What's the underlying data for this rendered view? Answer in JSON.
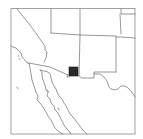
{
  "map": {
    "type": "locator-map",
    "region": "Southwestern United States and Northwestern Mexico",
    "highlight": {
      "shape": "square",
      "color": "#2a2a2a",
      "location": "southeastern Arizona, near US-Mexico border"
    },
    "colors": {
      "background": "#ffffff",
      "boundary": "#6a6a6a",
      "frame": "#8a8a8a",
      "highlight": "#2a2a2a"
    }
  }
}
